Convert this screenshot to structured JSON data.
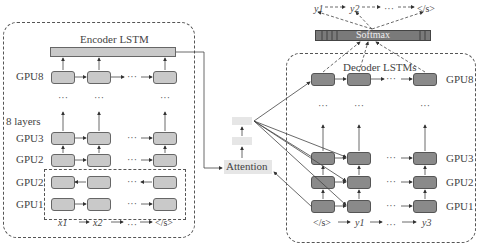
{
  "encoder": {
    "title": "Encoder LSTM",
    "layers_label": "8 layers",
    "gpu_labels": [
      "GPU8",
      "GPU3",
      "GPU2",
      "GPU2",
      "GPU1"
    ],
    "inputs": [
      "x1",
      "x2",
      "</s>"
    ],
    "ellipsis": "···"
  },
  "decoder": {
    "title": "Decoder LSTMs",
    "gpu_labels": [
      "GPU8",
      "GPU3",
      "GPU2",
      "GPU1"
    ],
    "inputs": [
      "</s>",
      "y1",
      "y3"
    ],
    "outputs": [
      "y1",
      "y2",
      "</s>"
    ],
    "ellipsis": "···"
  },
  "softmax": {
    "label": "Softmax"
  },
  "attention": {
    "label": "Attention"
  },
  "colors": {
    "encoder_cell": "#c9c9c9",
    "decoder_cell": "#8a8a8a",
    "softmax_bar": "#7a7a7a",
    "attention_box": "#e6e6e6"
  }
}
